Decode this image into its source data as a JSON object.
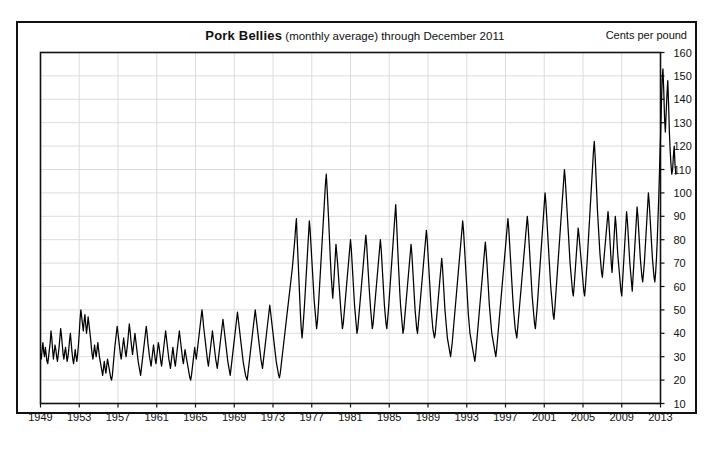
{
  "page": {
    "units_label": "Cents per pound",
    "ghost_header_text": "",
    "ghost_footer_text": ""
  },
  "title": {
    "main": "Pork Bellies",
    "subtitle": " (monthly average) through December 2011"
  },
  "chart_data": {
    "type": "line",
    "title": "Pork Bellies (monthly average) through December 2011",
    "xlabel": "",
    "ylabel": "Cents per pound",
    "xlim": [
      1949,
      2013
    ],
    "ylim": [
      10,
      160
    ],
    "grid": true,
    "legend": null,
    "line_color": "#000000",
    "grid_color": "#d8d8dc",
    "frame_color": "#111111",
    "xticks": [
      1949,
      1953,
      1957,
      1961,
      1965,
      1969,
      1973,
      1977,
      1981,
      1985,
      1989,
      1993,
      1997,
      2001,
      2005,
      2009,
      2013
    ],
    "yticks": [
      10,
      20,
      30,
      40,
      50,
      60,
      70,
      80,
      90,
      100,
      110,
      120,
      130,
      140,
      150,
      160
    ],
    "x_start": 1949.0,
    "x_step_years": 0.0833333,
    "series_name": "Pork bellies monthly average price",
    "values": [
      31,
      29,
      33,
      36,
      32,
      30,
      34,
      31,
      28,
      27,
      30,
      33,
      36,
      41,
      38,
      33,
      29,
      32,
      35,
      33,
      30,
      28,
      31,
      34,
      38,
      42,
      39,
      35,
      31,
      29,
      32,
      34,
      31,
      28,
      30,
      33,
      37,
      40,
      36,
      32,
      29,
      27,
      30,
      33,
      30,
      28,
      31,
      35,
      40,
      46,
      50,
      47,
      44,
      41,
      45,
      48,
      44,
      40,
      43,
      47,
      44,
      41,
      38,
      34,
      31,
      29,
      32,
      35,
      32,
      30,
      33,
      36,
      33,
      30,
      28,
      26,
      24,
      22,
      25,
      28,
      25,
      23,
      26,
      29,
      27,
      25,
      23,
      21,
      20,
      22,
      26,
      30,
      34,
      37,
      40,
      43,
      40,
      37,
      34,
      31,
      29,
      32,
      35,
      38,
      35,
      32,
      30,
      33,
      36,
      40,
      44,
      41,
      37,
      34,
      31,
      34,
      37,
      40,
      37,
      34,
      31,
      28,
      26,
      24,
      22,
      25,
      28,
      31,
      34,
      37,
      40,
      43,
      40,
      36,
      33,
      30,
      28,
      26,
      29,
      32,
      35,
      32,
      29,
      27,
      30,
      33,
      36,
      34,
      31,
      28,
      26,
      29,
      32,
      35,
      38,
      41,
      38,
      35,
      32,
      29,
      27,
      25,
      28,
      31,
      34,
      31,
      28,
      26,
      29,
      32,
      35,
      38,
      41,
      38,
      35,
      32,
      29,
      27,
      30,
      33,
      31,
      29,
      27,
      25,
      23,
      21,
      20,
      22,
      25,
      28,
      31,
      34,
      31,
      29,
      32,
      35,
      38,
      41,
      44,
      47,
      50,
      47,
      43,
      40,
      37,
      34,
      31,
      28,
      26,
      29,
      32,
      35,
      38,
      41,
      38,
      35,
      32,
      29,
      27,
      25,
      28,
      31,
      34,
      37,
      40,
      43,
      46,
      43,
      40,
      37,
      34,
      31,
      28,
      26,
      24,
      22,
      25,
      28,
      31,
      34,
      37,
      40,
      43,
      46,
      49,
      46,
      43,
      40,
      37,
      34,
      31,
      28,
      26,
      24,
      22,
      21,
      20,
      23,
      26,
      29,
      32,
      35,
      38,
      41,
      44,
      47,
      50,
      47,
      44,
      41,
      38,
      35,
      32,
      29,
      27,
      25,
      28,
      31,
      34,
      37,
      40,
      43,
      46,
      49,
      52,
      49,
      46,
      43,
      40,
      37,
      34,
      31,
      28,
      26,
      24,
      22,
      21,
      23,
      26,
      29,
      32,
      35,
      38,
      41,
      44,
      47,
      50,
      53,
      56,
      59,
      62,
      65,
      68,
      72,
      76,
      80,
      85,
      89,
      80,
      72,
      64,
      56,
      48,
      42,
      38,
      42,
      47,
      52,
      58,
      64,
      70,
      76,
      82,
      88,
      84,
      78,
      72,
      66,
      60,
      54,
      50,
      46,
      42,
      45,
      50,
      56,
      62,
      68,
      74,
      80,
      86,
      92,
      98,
      104,
      108,
      102,
      95,
      88,
      80,
      72,
      65,
      60,
      55,
      60,
      66,
      72,
      78,
      74,
      70,
      65,
      60,
      55,
      50,
      46,
      42,
      44,
      48,
      52,
      56,
      60,
      64,
      68,
      72,
      76,
      80,
      76,
      70,
      64,
      58,
      52,
      48,
      44,
      40,
      42,
      46,
      50,
      54,
      58,
      62,
      66,
      70,
      74,
      78,
      82,
      78,
      72,
      66,
      60,
      55,
      50,
      46,
      42,
      44,
      48,
      52,
      56,
      60,
      64,
      68,
      72,
      76,
      80,
      76,
      70,
      64,
      58,
      52,
      48,
      44,
      42,
      46,
      50,
      55,
      60,
      65,
      70,
      75,
      80,
      85,
      90,
      95,
      88,
      80,
      72,
      65,
      58,
      52,
      48,
      44,
      40,
      42,
      46,
      50,
      54,
      58,
      62,
      66,
      70,
      74,
      78,
      74,
      68,
      62,
      56,
      50,
      46,
      42,
      40,
      44,
      48,
      52,
      56,
      60,
      64,
      68,
      72,
      76,
      80,
      84,
      80,
      74,
      68,
      62,
      56,
      50,
      46,
      42,
      40,
      38,
      40,
      44,
      48,
      52,
      56,
      60,
      64,
      68,
      72,
      68,
      62,
      56,
      50,
      46,
      42,
      38,
      36,
      34,
      32,
      30,
      33,
      36,
      40,
      44,
      48,
      52,
      56,
      60,
      64,
      68,
      72,
      76,
      80,
      84,
      88,
      84,
      78,
      72,
      66,
      60,
      54,
      48,
      44,
      40,
      38,
      36,
      34,
      32,
      30,
      28,
      31,
      35,
      39,
      43,
      47,
      51,
      55,
      59,
      63,
      67,
      71,
      75,
      79,
      75,
      70,
      64,
      58,
      52,
      48,
      44,
      40,
      38,
      36,
      34,
      32,
      30,
      33,
      37,
      41,
      45,
      49,
      53,
      57,
      61,
      65,
      69,
      73,
      77,
      81,
      85,
      89,
      85,
      79,
      73,
      67,
      61,
      55,
      50,
      46,
      42,
      40,
      38,
      42,
      46,
      50,
      54,
      58,
      62,
      66,
      70,
      74,
      78,
      82,
      86,
      90,
      86,
      80,
      74,
      68,
      62,
      56,
      52,
      48,
      44,
      42,
      46,
      50,
      55,
      60,
      65,
      70,
      75,
      80,
      85,
      90,
      95,
      100,
      96,
      90,
      84,
      78,
      72,
      66,
      60,
      56,
      52,
      48,
      46,
      50,
      55,
      60,
      65,
      70,
      75,
      80,
      85,
      90,
      95,
      100,
      105,
      110,
      106,
      100,
      94,
      88,
      82,
      76,
      70,
      66,
      62,
      58,
      56,
      60,
      65,
      70,
      75,
      80,
      85,
      82,
      78,
      74,
      70,
      66,
      62,
      58,
      56,
      60,
      65,
      70,
      76,
      82,
      88,
      94,
      100,
      106,
      112,
      118,
      122,
      116,
      108,
      100,
      92,
      86,
      80,
      74,
      70,
      66,
      64,
      68,
      72,
      76,
      80,
      84,
      88,
      92,
      88,
      82,
      76,
      70,
      66,
      72,
      78,
      84,
      90,
      86,
      80,
      74,
      70,
      66,
      62,
      58,
      56,
      62,
      68,
      74,
      80,
      86,
      92,
      88,
      82,
      76,
      70,
      66,
      62,
      58,
      64,
      70,
      76,
      82,
      88,
      94,
      90,
      84,
      78,
      72,
      68,
      64,
      62,
      66,
      70,
      76,
      82,
      88,
      94,
      100,
      96,
      90,
      84,
      78,
      72,
      68,
      64,
      62,
      66,
      72,
      80,
      90,
      100,
      112,
      124,
      136,
      148,
      153,
      144,
      132,
      126,
      134,
      142,
      148,
      138,
      126,
      118,
      112,
      108,
      110,
      116,
      120,
      112,
      108
    ]
  }
}
